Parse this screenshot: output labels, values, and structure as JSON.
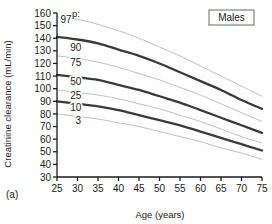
{
  "figure": {
    "panel_label": "(a)",
    "group_badge": "Males",
    "percentile_header": "p:"
  },
  "chart_data": {
    "type": "line",
    "title": "",
    "subtitle": "",
    "xlabel": "Age (years)",
    "ylabel": "Creatinine clearance (mL/min)",
    "xlim": [
      25,
      75
    ],
    "ylim": [
      30,
      160
    ],
    "xticks": [
      25,
      30,
      35,
      40,
      45,
      50,
      55,
      60,
      65,
      70,
      75
    ],
    "yticks": [
      30,
      40,
      50,
      60,
      70,
      80,
      90,
      100,
      110,
      120,
      130,
      140,
      150,
      160
    ],
    "xtick_labels": [
      "25",
      "30",
      "35",
      "40",
      "45",
      "50",
      "55",
      "60",
      "65",
      "70",
      "75"
    ],
    "ytick_labels": [
      "30",
      "40",
      "50",
      "60",
      "70",
      "80",
      "90",
      "100",
      "110",
      "120",
      "130",
      "140",
      "150",
      "160"
    ],
    "grid": false,
    "legend_position": "inline-labels",
    "annotations": [
      "Males",
      "(a)",
      "p:"
    ],
    "x": [
      25,
      30,
      35,
      40,
      45,
      50,
      55,
      60,
      65,
      70,
      75
    ],
    "series": [
      {
        "name": "97",
        "label": "97",
        "emphasis": "thin",
        "values": [
          157,
          155,
          151,
          146,
          140,
          133,
          126,
          118,
          110,
          102,
          94
        ]
      },
      {
        "name": "90",
        "label": "90",
        "emphasis": "thick",
        "values": [
          141,
          139,
          136,
          131,
          126,
          120,
          113,
          106,
          99,
          91,
          84
        ]
      },
      {
        "name": "75",
        "label": "75",
        "emphasis": "thin",
        "values": [
          126,
          124,
          121,
          117,
          112,
          107,
          101,
          95,
          88,
          81,
          74
        ]
      },
      {
        "name": "50",
        "label": "50",
        "emphasis": "thick",
        "values": [
          111,
          109,
          107,
          103,
          99,
          94,
          89,
          83,
          77,
          71,
          65
        ]
      },
      {
        "name": "25",
        "label": "25",
        "emphasis": "thin",
        "values": [
          99,
          97,
          95,
          92,
          88,
          84,
          79,
          74,
          68,
          62,
          57
        ]
      },
      {
        "name": "10",
        "label": "10",
        "emphasis": "thick",
        "values": [
          90,
          88,
          86,
          83,
          79,
          75,
          71,
          66,
          61,
          56,
          51
        ]
      },
      {
        "name": "3",
        "label": "3",
        "emphasis": "thin",
        "values": [
          80,
          78,
          76,
          73,
          70,
          66,
          62,
          58,
          53,
          49,
          44
        ]
      }
    ],
    "series_labels": [
      {
        "name": "97",
        "text": "97",
        "x": 27.2,
        "y": 152
      },
      {
        "name": "90",
        "text": "90",
        "x": 29.6,
        "y": 130
      },
      {
        "name": "75",
        "text": "75",
        "x": 29.6,
        "y": 118
      },
      {
        "name": "50",
        "text": "50",
        "x": 29.6,
        "y": 103
      },
      {
        "name": "25",
        "text": "25",
        "x": 29.6,
        "y": 92
      },
      {
        "name": "10",
        "text": "10",
        "x": 29.6,
        "y": 82
      },
      {
        "name": "3",
        "text": "3",
        "x": 30.2,
        "y": 72
      }
    ]
  },
  "style": {
    "axis_color": "#1a1a1a",
    "thick_curve_color": "#3a3a3a",
    "thin_curve_color": "#b9b9b9",
    "background": "#ffffff",
    "badge_border": "#6a6a6a"
  }
}
